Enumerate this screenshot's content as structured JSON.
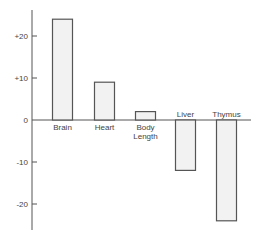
{
  "chart_data": {
    "type": "bar",
    "title": "",
    "xlabel": "",
    "ylabel": "",
    "categories": [
      "Brain",
      "Heart",
      "Body Length",
      "Liver",
      "Thymus"
    ],
    "category_label_lines": [
      [
        "Brain"
      ],
      [
        "Heart"
      ],
      [
        "Body",
        "Length"
      ],
      [
        "Liver"
      ],
      [
        "Thymus"
      ]
    ],
    "values": [
      24,
      9,
      2,
      -12,
      -24
    ],
    "ylim": [
      -26,
      26
    ],
    "yticks": [
      20,
      10,
      0,
      -10,
      -20
    ],
    "ytick_labels": [
      "+20",
      "+10",
      "0",
      "-10",
      "-20"
    ],
    "grid": false,
    "legend": null,
    "colors": {
      "bar_fill": "#f2f2f2",
      "bar_stroke": "#555555",
      "axis": "#555555"
    }
  }
}
